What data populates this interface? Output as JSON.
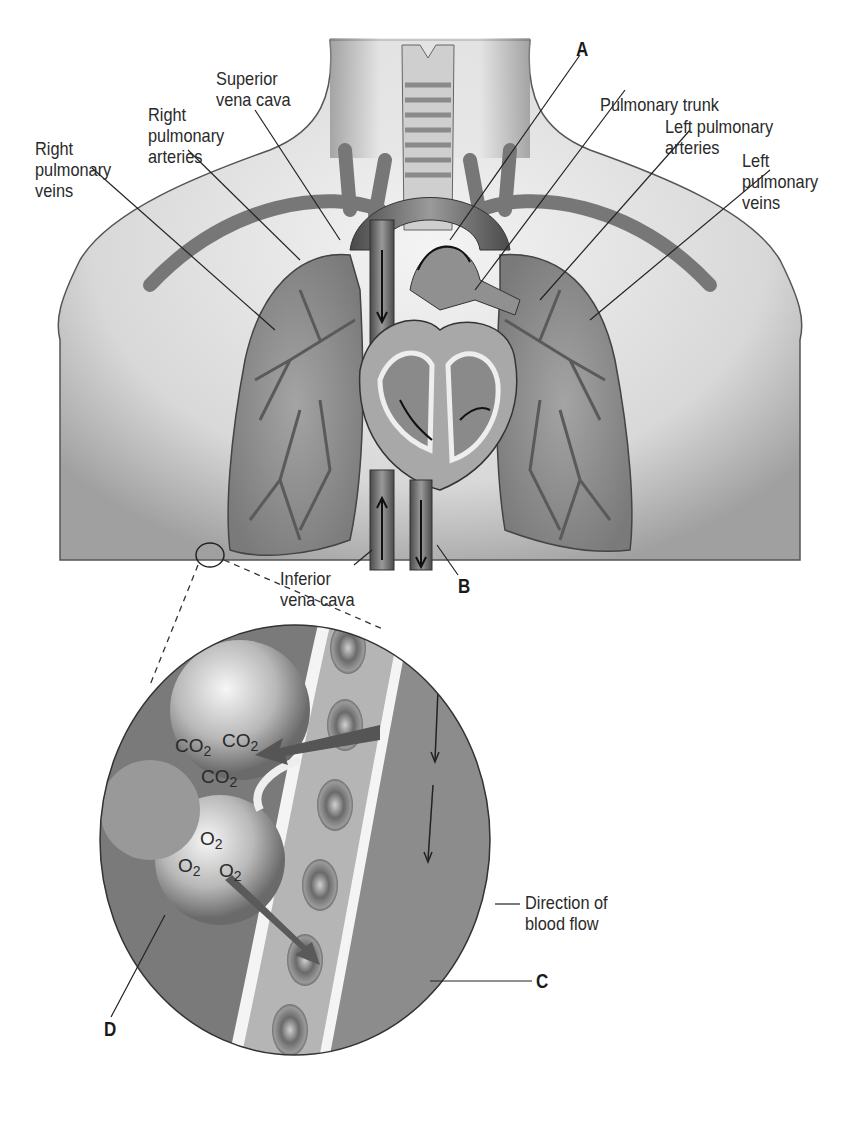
{
  "diagram": {
    "type": "anatomy-illustration",
    "labels": {
      "superior_vena_cava": "Superior\nvena cava",
      "right_pulmonary_arteries": "Right\npulmonary\narteries",
      "right_pulmonary_veins": "Right\npulmonary\nveins",
      "pulmonary_trunk": "Pulmonary trunk",
      "left_pulmonary_arteries": "Left pulmonary\narteries",
      "left_pulmonary_veins": "Left\npulmonary\nveins",
      "inferior_vena_cava": "Inferior\nvena cava",
      "direction_of_blood_flow": "Direction of\nblood flow"
    },
    "letter_markers": {
      "a": "A",
      "b": "B",
      "c": "C",
      "d": "D"
    },
    "gases": {
      "co2_base": "CO",
      "o2_base": "O",
      "subscript": "2",
      "co2_count": 3,
      "o2_count": 3
    },
    "colors": {
      "skin_light": "#e8e8e8",
      "skin_shadow": "#9a9a9a",
      "lung_fill": "#8e8e8e",
      "vessel": "#6e6e6e",
      "heart": "#a8a8a8",
      "line": "#222222"
    }
  }
}
